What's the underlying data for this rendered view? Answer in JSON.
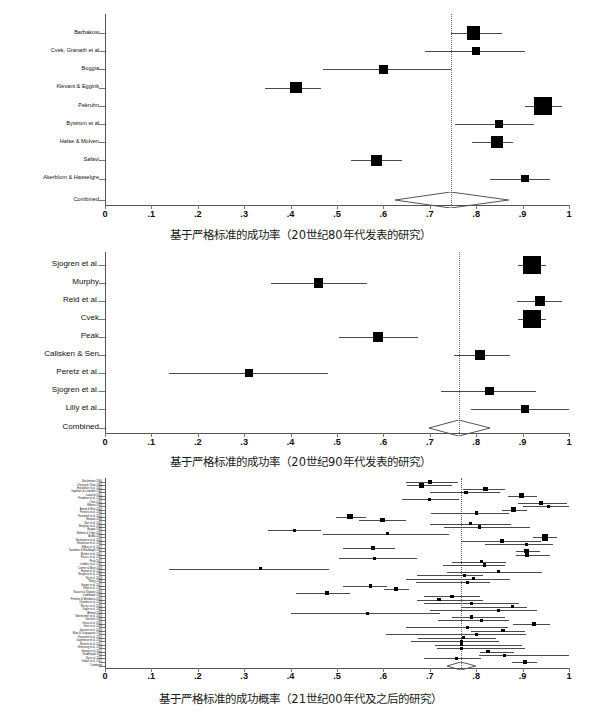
{
  "figure": {
    "type": "forest-plot-figure",
    "panel_count": 3
  },
  "axis": {
    "ticks": [
      "0",
      ".1",
      ".2",
      ".3",
      ".4",
      ".5",
      ".6",
      ".7",
      ".8",
      ".9",
      "1"
    ],
    "tick_values": [
      0,
      0.1,
      0.2,
      0.3,
      0.4,
      0.5,
      0.6,
      0.7,
      0.8,
      0.9,
      1.0
    ],
    "xmin": 0,
    "xmax": 1,
    "combined_row_label": "Combined"
  },
  "chart_data": [
    {
      "id": "panel-1980s",
      "type": "forest",
      "title": "",
      "xlabel": "基于严格标准的成功率（20世纪80年代发表的研究）",
      "ylabel": "",
      "xlim": [
        0,
        1
      ],
      "grid": false,
      "legend": "none",
      "reference_line": 0.745,
      "studies": [
        {
          "label": "Barbakow",
          "estimate": 0.795,
          "ci_low": 0.745,
          "ci_high": 0.855,
          "weight": 0.62
        },
        {
          "label": "Cvek, Granath et al",
          "estimate": 0.8,
          "ci_low": 0.69,
          "ci_high": 0.905,
          "weight": 0.2
        },
        {
          "label": "Boggia",
          "estimate": 0.6,
          "ci_low": 0.47,
          "ci_high": 0.745,
          "weight": 0.26
        },
        {
          "label": "Klevant & Eggink",
          "estimate": 0.412,
          "ci_low": 0.345,
          "ci_high": 0.465,
          "weight": 0.52
        },
        {
          "label": "Pekruhn",
          "estimate": 0.945,
          "ci_low": 0.905,
          "ci_high": 0.985,
          "weight": 1.0
        },
        {
          "label": "Bystrom et al",
          "estimate": 0.85,
          "ci_low": 0.755,
          "ci_high": 0.925,
          "weight": 0.22
        },
        {
          "label": "Halse & Molven",
          "estimate": 0.845,
          "ci_low": 0.79,
          "ci_high": 0.88,
          "weight": 0.55
        },
        {
          "label": "Safavi",
          "estimate": 0.585,
          "ci_low": 0.53,
          "ci_high": 0.64,
          "weight": 0.46
        },
        {
          "label": "Akerblom & Hasselgre",
          "estimate": 0.905,
          "ci_low": 0.83,
          "ci_high": 0.96,
          "weight": 0.21
        }
      ],
      "combined": {
        "label": "Combined",
        "estimate": 0.745,
        "ci_low": 0.625,
        "ci_high": 0.87
      }
    },
    {
      "id": "panel-1990s",
      "type": "forest",
      "title": "",
      "xlabel": "基于严格标准的成功率（20世纪90年代发表的研究）",
      "ylabel": "",
      "xlim": [
        0,
        1
      ],
      "grid": false,
      "legend": "none",
      "reference_line": 0.762,
      "studies": [
        {
          "label": "Sjogren et al.",
          "estimate": 0.92,
          "ci_low": 0.89,
          "ci_high": 0.95,
          "weight": 1.0
        },
        {
          "label": "Murphy",
          "estimate": 0.46,
          "ci_low": 0.358,
          "ci_high": 0.565,
          "weight": 0.35
        },
        {
          "label": "Reid et al.",
          "estimate": 0.938,
          "ci_low": 0.888,
          "ci_high": 0.985,
          "weight": 0.4
        },
        {
          "label": "Cvek",
          "estimate": 0.92,
          "ci_low": 0.89,
          "ci_high": 0.95,
          "weight": 1.0
        },
        {
          "label": "Peak",
          "estimate": 0.588,
          "ci_low": 0.505,
          "ci_high": 0.675,
          "weight": 0.38
        },
        {
          "label": "Calisken & Sen",
          "estimate": 0.808,
          "ci_low": 0.752,
          "ci_high": 0.872,
          "weight": 0.38
        },
        {
          "label": "Peretz et al.",
          "estimate": 0.31,
          "ci_low": 0.138,
          "ci_high": 0.48,
          "weight": 0.2
        },
        {
          "label": "Sjogren et al.",
          "estimate": 0.828,
          "ci_low": 0.725,
          "ci_high": 0.928,
          "weight": 0.3
        },
        {
          "label": "Lilly et al.",
          "estimate": 0.905,
          "ci_low": 0.788,
          "ci_high": 1.0,
          "weight": 0.24
        }
      ],
      "combined": {
        "label": "Combined",
        "estimate": 0.762,
        "ci_low": 0.698,
        "ci_high": 0.83
      }
    },
    {
      "id": "panel-2000s",
      "type": "forest",
      "title": "",
      "xlabel": "基于严格标准的成功概率（21世纪00年代及之后的研究）",
      "ylabel": "",
      "xlim": [
        0,
        1
      ],
      "grid": false,
      "legend": "none",
      "reference_line": 0.768,
      "studies": [
        {
          "label": "Brushmann 2000",
          "estimate": 0.7,
          "ci_low": 0.648,
          "ci_high": 0.76,
          "weight": 0.28
        },
        {
          "label": "Cheung & Chan 2000",
          "estimate": 0.682,
          "ci_low": 0.65,
          "ci_high": 0.748,
          "weight": 0.42
        },
        {
          "label": "Hoskinson et al. 2002",
          "estimate": 0.82,
          "ci_low": 0.772,
          "ci_high": 0.862,
          "weight": 0.52
        },
        {
          "label": "Ingelhart & Lumsden 2002",
          "estimate": 0.778,
          "ci_low": 0.7,
          "ci_high": 0.852,
          "weight": 0.18
        },
        {
          "label": "Lazarski 2001",
          "estimate": 0.898,
          "ci_low": 0.868,
          "ci_high": 0.93,
          "weight": 0.55
        },
        {
          "label": "Friedman et al. 2003",
          "estimate": 0.7,
          "ci_low": 0.64,
          "ci_high": 0.762,
          "weight": 0.22
        },
        {
          "label": "Chen 2002",
          "estimate": 0.94,
          "ci_low": 0.89,
          "ci_high": 0.995,
          "weight": 0.26
        },
        {
          "label": "Ribeiro 2003",
          "estimate": 0.955,
          "ci_low": 0.9,
          "ci_high": 1.0,
          "weight": 0.2
        },
        {
          "label": "Amani & Rive 2004",
          "estimate": 0.88,
          "ci_low": 0.855,
          "ci_high": 0.91,
          "weight": 0.5
        },
        {
          "label": "Ferreira et al. 2004",
          "estimate": 0.8,
          "ci_low": 0.702,
          "ci_high": 0.87,
          "weight": 0.22
        },
        {
          "label": "Farzaneh et al. 2004",
          "estimate": 0.528,
          "ci_low": 0.498,
          "ci_high": 0.562,
          "weight": 0.6
        },
        {
          "label": "Marquis 2006",
          "estimate": 0.598,
          "ci_low": 0.548,
          "ci_high": 0.648,
          "weight": 0.4
        },
        {
          "label": "Nair et al. 2005",
          "estimate": 0.788,
          "ci_low": 0.7,
          "ci_high": 0.875,
          "weight": 0.3
        },
        {
          "label": "Berghuis et al. 2005",
          "estimate": 0.808,
          "ci_low": 0.73,
          "ci_high": 0.915,
          "weight": 0.18
        },
        {
          "label": "Bragaa 2005",
          "estimate": 0.408,
          "ci_low": 0.352,
          "ci_high": 0.465,
          "weight": 0.22
        },
        {
          "label": "Waltimo & Trope 2005",
          "estimate": 0.608,
          "ci_low": 0.47,
          "ci_high": 0.742,
          "weight": 0.16
        },
        {
          "label": "Ardilla 2005",
          "estimate": 0.948,
          "ci_low": 0.922,
          "ci_high": 0.975,
          "weight": 0.82
        },
        {
          "label": "Bartkiewicz et al. 2006",
          "estimate": 0.855,
          "ci_low": 0.768,
          "ci_high": 0.94,
          "weight": 0.3
        },
        {
          "label": "Hoskinson et al. 2006",
          "estimate": 0.908,
          "ci_low": 0.818,
          "ci_high": 0.965,
          "weight": 0.24
        },
        {
          "label": "Wilkes et al. 2007",
          "estimate": 0.578,
          "ci_low": 0.512,
          "ci_high": 0.625,
          "weight": 0.36
        },
        {
          "label": "Saunders & Elsabbagh 2007",
          "estimate": 0.908,
          "ci_low": 0.885,
          "ci_high": 0.938,
          "weight": 0.44
        },
        {
          "label": "Molven et al. 2007",
          "estimate": 0.91,
          "ci_low": 0.885,
          "ci_high": 0.96,
          "weight": 0.46
        },
        {
          "label": "Ricucci et al. 2007",
          "estimate": 0.58,
          "ci_low": 0.505,
          "ci_high": 0.672,
          "weight": 0.18
        },
        {
          "label": "Peak 2007",
          "estimate": 0.812,
          "ci_low": 0.748,
          "ci_high": 0.865,
          "weight": 0.22
        },
        {
          "label": "Lindfors et al. 2007",
          "estimate": 0.818,
          "ci_low": 0.728,
          "ci_high": 0.862,
          "weight": 0.2
        },
        {
          "label": "Conner & Marx 2008",
          "estimate": 0.335,
          "ci_low": 0.138,
          "ci_high": 0.482,
          "weight": 0.14
        },
        {
          "label": "Ramos et al. 2007",
          "estimate": 0.848,
          "ci_low": 0.738,
          "ci_high": 0.942,
          "weight": 0.16
        },
        {
          "label": "Bergkvist et al. 2008",
          "estimate": 0.775,
          "ci_low": 0.672,
          "ci_high": 0.815,
          "weight": 0.18
        },
        {
          "label": "Ng et al. 2008",
          "estimate": 0.795,
          "ci_low": 0.648,
          "ci_high": 0.872,
          "weight": 0.16
        },
        {
          "label": "Wong 2008",
          "estimate": 0.782,
          "ci_low": 0.67,
          "ci_high": 0.83,
          "weight": 0.16
        },
        {
          "label": "Gregor et al. 2007",
          "estimate": 0.572,
          "ci_low": 0.512,
          "ci_high": 0.608,
          "weight": 0.26
        },
        {
          "label": "Patel et al. 2007",
          "estimate": 0.628,
          "ci_low": 0.602,
          "ci_high": 0.655,
          "weight": 0.36
        },
        {
          "label": "Navarro & Klopatto 2009",
          "estimate": 0.478,
          "ci_low": 0.412,
          "ci_high": 0.528,
          "weight": 0.3
        },
        {
          "label": "Lindeboom 2009",
          "estimate": 0.748,
          "ci_low": 0.688,
          "ci_high": 0.808,
          "weight": 0.22
        },
        {
          "label": "Pettiette & Mendonca 2009",
          "estimate": 0.72,
          "ci_low": 0.672,
          "ci_high": 0.815,
          "weight": 0.22
        },
        {
          "label": "Chandra et al. 2009",
          "estimate": 0.79,
          "ci_low": 0.688,
          "ci_high": 0.892,
          "weight": 0.16
        },
        {
          "label": "Ricucci et al. 2009",
          "estimate": 0.878,
          "ci_low": 0.768,
          "ci_high": 0.91,
          "weight": 0.18
        },
        {
          "label": "Doyle et al. 2009",
          "estimate": 0.848,
          "ci_low": 0.7,
          "ci_high": 0.932,
          "weight": 0.16
        },
        {
          "label": "Ahmed 2009",
          "estimate": 0.565,
          "ci_low": 0.4,
          "ci_high": 0.722,
          "weight": 0.14
        },
        {
          "label": "Oberlechner et al. 2009",
          "estimate": 0.79,
          "ci_low": 0.748,
          "ci_high": 0.862,
          "weight": 0.26
        },
        {
          "label": "Taschieri 2009",
          "estimate": 0.812,
          "ci_low": 0.718,
          "ci_high": 0.87,
          "weight": 0.2
        },
        {
          "label": "Imura et al. 2009",
          "estimate": 0.925,
          "ci_low": 0.88,
          "ci_high": 0.958,
          "weight": 0.3
        },
        {
          "label": "Steir et al. 2009",
          "estimate": 0.782,
          "ci_low": 0.648,
          "ci_high": 0.868,
          "weight": 0.16
        },
        {
          "label": "Janszen et al. 2009",
          "estimate": 0.858,
          "ci_low": 0.788,
          "ci_high": 0.905,
          "weight": 0.24
        },
        {
          "label": "Mian & Uruguaysan 2010",
          "estimate": 0.8,
          "ci_low": 0.605,
          "ci_high": 0.908,
          "weight": 0.14
        },
        {
          "label": "Farzaneh et al. 2010",
          "estimate": 0.772,
          "ci_low": 0.675,
          "ci_high": 0.842,
          "weight": 0.14
        },
        {
          "label": "Dagmeeun et al. 2010",
          "estimate": 0.768,
          "ci_low": 0.66,
          "ci_high": 0.85,
          "weight": 0.14
        },
        {
          "label": "Rosetta et al. 2010",
          "estimate": 0.768,
          "ci_low": 0.712,
          "ci_high": 0.898,
          "weight": 0.14
        },
        {
          "label": "Kirkevang et al. 2010",
          "estimate": 0.768,
          "ci_low": 0.715,
          "ci_high": 0.905,
          "weight": 0.16
        },
        {
          "label": "Huang et al. 2011",
          "estimate": 0.825,
          "ci_low": 0.808,
          "ci_high": 0.882,
          "weight": 0.34
        },
        {
          "label": "Torabinejad 2011",
          "estimate": 0.862,
          "ci_low": 0.805,
          "ci_high": 1.0,
          "weight": 0.16
        },
        {
          "label": "Ng et al. 2011",
          "estimate": 0.758,
          "ci_low": 0.688,
          "ci_high": 0.81,
          "weight": 0.2
        },
        {
          "label": "Yoldas et al. 2012",
          "estimate": 0.905,
          "ci_low": 0.878,
          "ci_high": 0.93,
          "weight": 0.42
        }
      ],
      "combined": {
        "label": "Combined",
        "estimate": 0.768,
        "ci_low": 0.738,
        "ci_high": 0.8
      }
    }
  ]
}
